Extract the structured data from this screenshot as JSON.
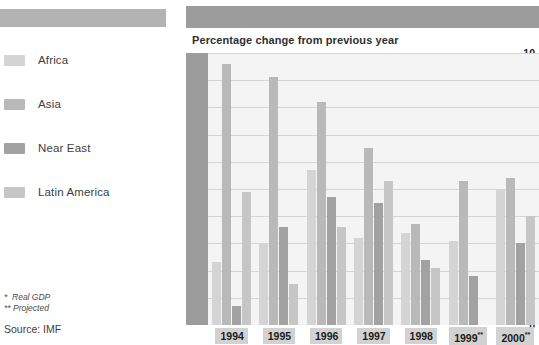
{
  "chart_data": {
    "type": "bar",
    "title": "Percentage change from previous year",
    "xlabel": "",
    "ylabel": "",
    "ylim": [
      0,
      10
    ],
    "yticks": [
      0,
      1,
      2,
      3,
      4,
      5,
      6,
      7,
      8,
      9,
      10
    ],
    "grid": true,
    "legend_position": "left",
    "categories": [
      "1994",
      "1995",
      "1996",
      "1997",
      "1998",
      "1999**",
      "2000**"
    ],
    "series": [
      {
        "name": "Africa",
        "color": "#d4d4d4",
        "values": [
          2.3,
          3.0,
          5.7,
          3.2,
          3.4,
          3.1,
          5.0
        ]
      },
      {
        "name": "Asia",
        "color": "#b9b9b9",
        "values": [
          9.6,
          9.1,
          8.2,
          6.5,
          3.7,
          5.3,
          5.4
        ]
      },
      {
        "name": "Near East",
        "color": "#a2a2a2",
        "values": [
          0.7,
          3.6,
          4.7,
          4.5,
          2.4,
          1.8,
          3.0
        ]
      },
      {
        "name": "Latin America",
        "color": "#c6c6c6",
        "values": [
          4.9,
          1.5,
          3.6,
          5.3,
          2.1,
          0.0,
          4.0
        ]
      }
    ],
    "notes": [
      "*  Real GDP",
      "** Projected"
    ],
    "source": "Source: IMF"
  },
  "legend": {
    "items": [
      {
        "label": "Africa"
      },
      {
        "label": "Asia"
      },
      {
        "label": "Near East"
      },
      {
        "label": "Latin America"
      }
    ]
  },
  "footnotes": {
    "note_1": "*  Real GDP",
    "note_2": "** Projected",
    "source": "Source: IMF"
  }
}
